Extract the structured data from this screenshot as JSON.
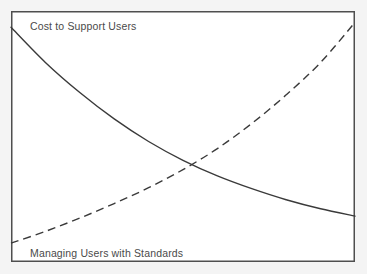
{
  "figure": {
    "background_color": "#f4f4f4",
    "plot_background_color": "#ffffff",
    "frame_color": "#4f4f4f",
    "frame": {
      "x": 11,
      "y": 11,
      "width": 344,
      "height": 251
    }
  },
  "labels": {
    "cost_curve_label": "Cost to Support Users",
    "standards_curve_label": "Managing Users with Standards"
  },
  "chart_data": {
    "type": "line",
    "title": "",
    "subtitle": "",
    "xlabel": "",
    "ylabel": "",
    "grid": false,
    "legend_position": "inline-annotation",
    "axis_ticks": false,
    "xlim": [
      0,
      1
    ],
    "ylim": [
      0,
      1
    ],
    "annotations": [
      {
        "text": "Cost to Support Users",
        "x": 0.055,
        "y": 0.955,
        "attached_series": "Cost to Support Users"
      },
      {
        "text": "Managing Users with Standards",
        "x": 0.055,
        "y": 0.048,
        "attached_series": "Managing Users with Standards"
      }
    ],
    "intersection": {
      "x": 0.512,
      "y": 0.355
    },
    "series": [
      {
        "name": "Cost to Support Users",
        "style": "solid",
        "color": "#3a3a3a",
        "width": 1.4,
        "shape": "decreasing-convex",
        "x": [
          0.0,
          0.1,
          0.2,
          0.3,
          0.4,
          0.5,
          0.6,
          0.7,
          0.8,
          0.9,
          1.0
        ],
        "y": [
          0.935,
          0.795,
          0.675,
          0.57,
          0.48,
          0.405,
          0.343,
          0.292,
          0.248,
          0.212,
          0.183
        ]
      },
      {
        "name": "Managing Users with Standards",
        "style": "dashed",
        "color": "#3a3a3a",
        "width": 1.4,
        "dash_pattern": [
          8,
          5
        ],
        "shape": "increasing-convex",
        "x": [
          0.0,
          0.1,
          0.2,
          0.3,
          0.4,
          0.5,
          0.6,
          0.7,
          0.8,
          0.9,
          1.0
        ],
        "y": [
          0.075,
          0.122,
          0.175,
          0.233,
          0.296,
          0.368,
          0.452,
          0.552,
          0.666,
          0.795,
          0.955
        ]
      }
    ]
  }
}
